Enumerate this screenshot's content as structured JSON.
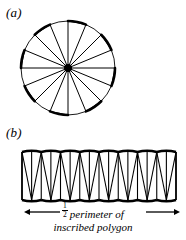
{
  "figure": {
    "background_color": "#ffffff",
    "ink_color": "#000000",
    "panels": [
      {
        "id": "a",
        "label": "(a)",
        "description": "circle divided into radial sectors of an inscribed polygon"
      },
      {
        "id": "b",
        "label": "(b)",
        "description": "sectors rearranged alternately into a strip"
      }
    ]
  },
  "labels": {
    "panel_a": "(a)",
    "panel_b": "(b)"
  },
  "caption": {
    "fraction_numerator": "1",
    "fraction_denominator": "2",
    "line1_text": "perimeter of",
    "line2_text": "inscribed polygon",
    "full_text": "1/2 perimeter of inscribed polygon",
    "left_arrow": "left-arrow",
    "right_arrow": "right-arrow"
  },
  "chart_data": {
    "type": "diagram",
    "panel_a": {
      "shape": "circle",
      "center_x": 68,
      "center_y": 68,
      "radius": 47,
      "sector_count": 16,
      "sector_angle_degrees": 22.5,
      "spoke_count": 16,
      "hub_marker": "filled-dot",
      "hub_radius": 4,
      "thick_arc_sectors": [
        0,
        2,
        4,
        6,
        8,
        10,
        12,
        14
      ],
      "thin_arc_sectors": [
        1,
        3,
        5,
        7,
        9,
        11,
        13,
        15
      ],
      "chord_style": "inscribed-polygon-chords"
    },
    "panel_b": {
      "shape": "sector-strip",
      "left_x": 22,
      "right_x": 176,
      "top_y": 152,
      "bottom_y": 200,
      "triangle_count": 16,
      "up_pointing_count": 8,
      "down_pointing_count": 8,
      "base_width": 19.25,
      "height": 48,
      "arc_bulge": 2.5
    },
    "arrows": {
      "left_arrow_x_start": 60,
      "left_arrow_x_end": 24,
      "right_arrow_x_start": 146,
      "right_arrow_x_end": 180,
      "arrow_y": 212
    }
  }
}
